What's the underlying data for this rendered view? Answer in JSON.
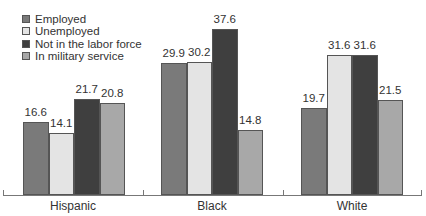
{
  "chart_data": {
    "type": "bar",
    "title": "",
    "xlabel": "",
    "ylabel": "",
    "ylim": [
      0,
      40
    ],
    "grid": false,
    "legend_position": "top-left",
    "categories": [
      "Hispanic",
      "Black",
      "White"
    ],
    "series": [
      {
        "name": "Employed",
        "color": "#7a7a7a",
        "values": [
          16.6,
          29.9,
          19.7
        ]
      },
      {
        "name": "Unemployed",
        "color": "#e4e4e4",
        "values": [
          14.1,
          30.2,
          31.6
        ]
      },
      {
        "name": "Not in the labor force",
        "color": "#3f3f3f",
        "values": [
          21.7,
          37.6,
          31.6
        ]
      },
      {
        "name": "In military service",
        "color": "#a8a8a8",
        "values": [
          20.8,
          14.8,
          21.5
        ]
      }
    ],
    "value_labels": [
      [
        "16.6",
        "14.1",
        "21.7",
        "20.8"
      ],
      [
        "29.9",
        "30.2",
        "37.6",
        "14.8"
      ],
      [
        "19.7",
        "31.6",
        "31.6",
        "21.5"
      ]
    ]
  }
}
